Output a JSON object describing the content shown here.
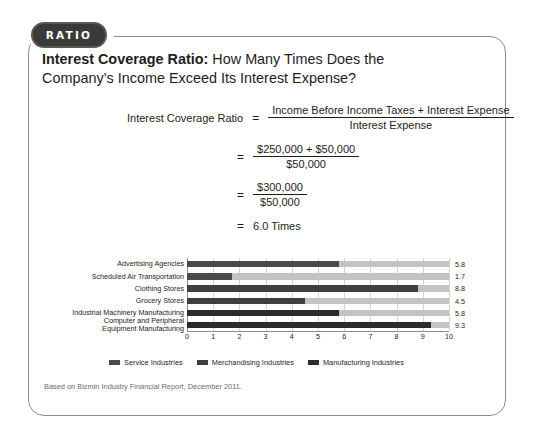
{
  "badge": {
    "label": "RATIO"
  },
  "heading": {
    "lead": "Interest Coverage Ratio:",
    "rest": " How Many Times Does the Company’s Income Exceed Its Interest Expense?"
  },
  "formula": {
    "label": "Interest Coverage Ratio",
    "equals": "=",
    "line1": {
      "numerator": "Income Before Income Taxes + Interest Expense",
      "denominator": "Interest Expense"
    },
    "line2": {
      "numerator": "$250,000 + $50,000",
      "denominator": "$50,000"
    },
    "line3": {
      "numerator": "$300,000",
      "denominator": "$50,000"
    },
    "line4": "6.0 Times"
  },
  "chart_data": {
    "type": "bar",
    "orientation": "horizontal",
    "title": "",
    "xlabel": "",
    "ylabel": "",
    "xlim": [
      0,
      10
    ],
    "grid": true,
    "legend_position": "bottom-left",
    "categories": [
      "Advertising Agencies",
      "Scheduled Air Transportation",
      "Clothing Stores",
      "Grocery Stores",
      "Industrial Machinery Manufacturing",
      "Computer and Peripheral Equipment Manufacturing"
    ],
    "category_lines": [
      [
        "Advertising Agencies"
      ],
      [
        "Scheduled Air Transportation"
      ],
      [
        "Clothing Stores"
      ],
      [
        "Grocery Stores"
      ],
      [
        "Industrial Machinery Manufacturing"
      ],
      [
        "Computer and Peripheral",
        "Equipment Manufacturing"
      ]
    ],
    "values": [
      5.8,
      1.7,
      8.8,
      4.5,
      5.8,
      9.3
    ],
    "value_labels": [
      "5.8",
      "1.7",
      "8.8",
      "4.5",
      "5.8",
      "9.3"
    ],
    "groups": [
      "service",
      "service",
      "merchandising",
      "merchandising",
      "manufacturing",
      "manufacturing"
    ],
    "ticks": [
      "0",
      "1",
      "2",
      "3",
      "4",
      "5",
      "6",
      "7",
      "8",
      "9",
      "10"
    ],
    "series": [
      {
        "name": "Service Industries",
        "color": "#4a4a4a"
      },
      {
        "name": "Merchandising Industries",
        "color": "#3f3f3f"
      },
      {
        "name": "Manufacturing Industries",
        "color": "#2b2b2b"
      }
    ],
    "track_color": "#c3c3c3"
  },
  "legend": [
    {
      "label": "Service Industries",
      "key": "svc"
    },
    {
      "label": "Merchandising Industries",
      "key": "mch"
    },
    {
      "label": "Manufacturing Industries",
      "key": "mfg"
    }
  ],
  "source": {
    "text": "Based on Bizmin Industry Financial Report, December 2011."
  }
}
